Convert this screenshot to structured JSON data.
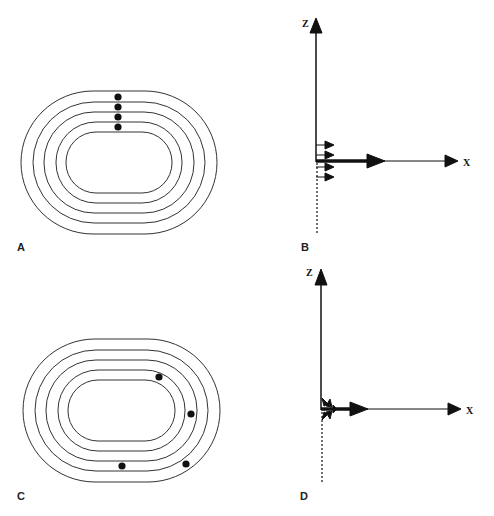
{
  "panels": [
    {
      "id": "A",
      "label": "A",
      "type": "concentric-tracks",
      "track_count": 5,
      "dots": [
        {
          "x": 118,
          "y": 97
        },
        {
          "x": 118,
          "y": 107
        },
        {
          "x": 118,
          "y": 117
        },
        {
          "x": 118,
          "y": 127
        }
      ]
    },
    {
      "id": "B",
      "label": "B",
      "type": "vector-axes",
      "axis_z": "Z",
      "axis_x": "X"
    },
    {
      "id": "C",
      "label": "C",
      "type": "concentric-tracks",
      "track_count": 5,
      "dots": [
        {
          "x": 159,
          "y": 377
        },
        {
          "x": 191,
          "y": 414
        },
        {
          "x": 122,
          "y": 466
        },
        {
          "x": 186,
          "y": 464
        }
      ]
    },
    {
      "id": "D",
      "label": "D",
      "type": "vector-axes",
      "axis_z": "Z",
      "axis_x": "X"
    }
  ],
  "colors": {
    "line": "#222222",
    "background": "#ffffff"
  }
}
